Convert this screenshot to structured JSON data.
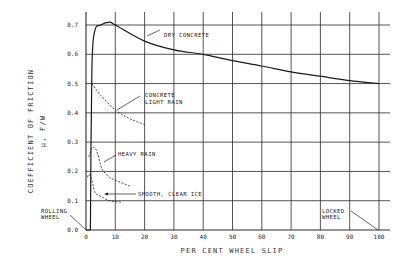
{
  "chart_data": {
    "type": "line",
    "title": "",
    "xlabel": "PER CENT WHEEL SLIP",
    "ylabel": "COEFFICIENT OF FRICTION",
    "ylabel_sub": "μ, F/W",
    "xlim": [
      0,
      100
    ],
    "ylim": [
      0.0,
      0.7
    ],
    "grid": true,
    "x_ticks": [
      "0",
      "10",
      "20",
      "30",
      "40",
      "50",
      "60",
      "70",
      "80",
      "90",
      "100"
    ],
    "y_ticks": [
      "0.0",
      "0.1",
      "0.2",
      "0.3",
      "0.4",
      "0.5",
      "0.6",
      "0.7"
    ],
    "series": [
      {
        "name": "DRY CONCRETE",
        "style": "solid",
        "x": [
          1.5,
          2,
          3,
          5,
          8,
          10,
          20,
          30,
          40,
          50,
          60,
          70,
          80,
          90,
          100
        ],
        "y": [
          0.0,
          0.55,
          0.68,
          0.7,
          0.71,
          0.7,
          0.645,
          0.615,
          0.6,
          0.578,
          0.56,
          0.54,
          0.525,
          0.51,
          0.5
        ]
      },
      {
        "name": "CONCRETE LIGHT RAIN",
        "style": "dashed",
        "x": [
          2,
          5,
          10,
          15,
          20
        ],
        "y": [
          0.5,
          0.46,
          0.41,
          0.38,
          0.36
        ]
      },
      {
        "name": "HEAVY RAIN",
        "style": "dashed",
        "x": [
          1,
          2,
          3,
          4,
          5,
          6,
          8,
          10,
          15
        ],
        "y": [
          0.25,
          0.28,
          0.28,
          0.26,
          0.22,
          0.2,
          0.18,
          0.17,
          0.15
        ]
      },
      {
        "name": "SMOOTH, CLEAR ICE",
        "style": "dashed",
        "x": [
          0.5,
          1,
          2,
          3,
          4,
          6,
          8,
          12
        ],
        "y": [
          0.18,
          0.19,
          0.17,
          0.13,
          0.12,
          0.11,
          0.1,
          0.095
        ]
      }
    ],
    "annotations": [
      {
        "text": "DRY CONCRETE",
        "points_to": [
          12,
          0.69
        ]
      },
      {
        "text": "CONCRETE",
        "line2": "LIGHT RAIN",
        "points_to": [
          10,
          0.41
        ]
      },
      {
        "text": "HEAVY RAIN",
        "points_to": [
          5,
          0.23
        ]
      },
      {
        "text": "SMOOTH, CLEAR ICE",
        "points_to": [
          7,
          0.125
        ]
      },
      {
        "text": "ROLLING",
        "line2": "WHEEL",
        "points_to": [
          0,
          0.0
        ]
      },
      {
        "text": "LOCKED",
        "line2": "WHEEL",
        "points_to": [
          100,
          0.0
        ]
      }
    ]
  },
  "labels": {
    "xlabel": "PER CENT WHEEL SLIP",
    "ylabel": "COEFFICIENT OF FRICTION",
    "ylabel_sub": "μ, F/W",
    "dry": "DRY CONCRETE",
    "light1": "CONCRETE",
    "light2": "LIGHT RAIN",
    "heavy": "HEAVY RAIN",
    "ice": "SMOOTH, CLEAR ICE",
    "rolling1": "ROLLING",
    "rolling2": "WHEEL",
    "locked1": "LOCKED",
    "locked2": "WHEEL"
  },
  "colors": {
    "ink": "#1a1a1a",
    "grid": "#2a2a2a",
    "background": "#ffffff"
  }
}
